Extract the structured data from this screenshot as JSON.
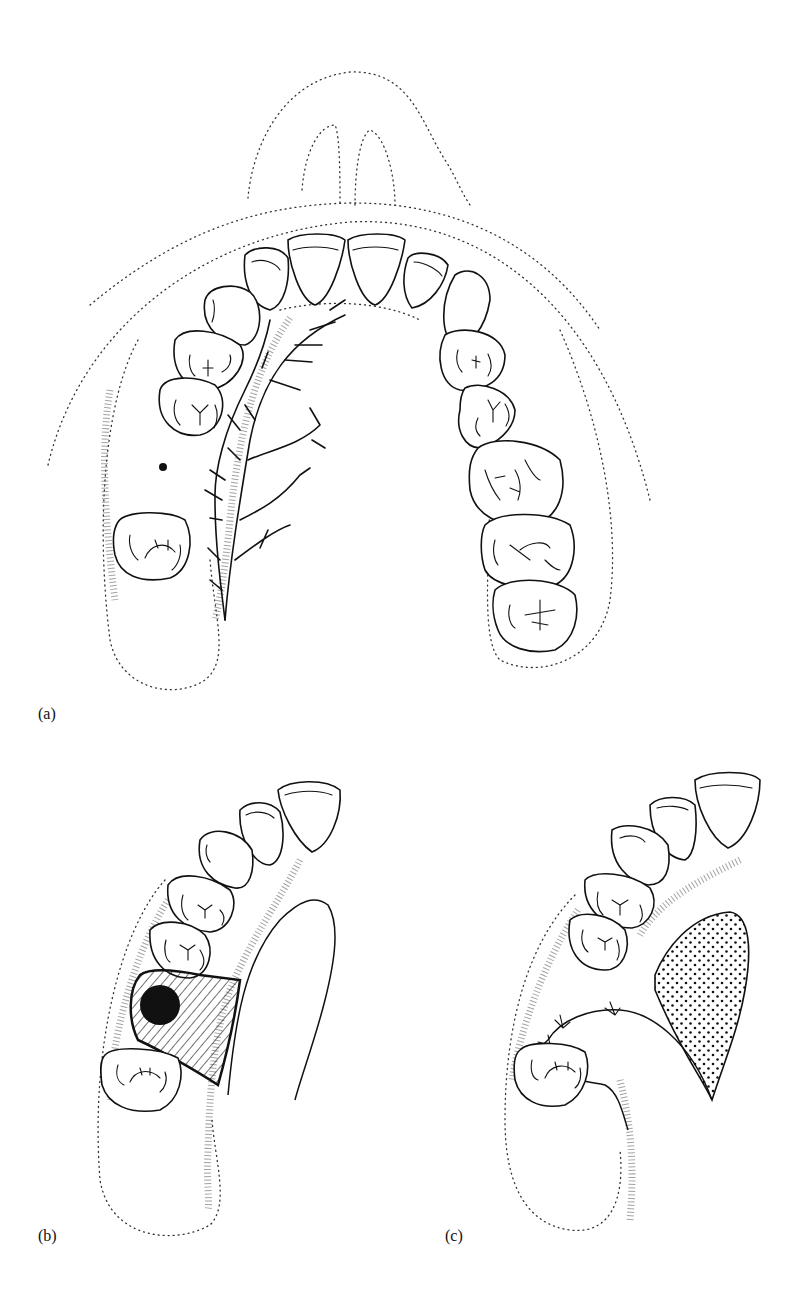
{
  "figure": {
    "panels": [
      {
        "id": "a",
        "label": "(a)",
        "description": "Full maxillary dental arch with dotted lip/nose outline, branching nerve/vessel pattern on left palate, stippled gingival margin and a dot marking the missing tooth site"
      },
      {
        "id": "b",
        "label": "(b)",
        "description": "Left half of arch showing hatched rectangular lesion area with a solid black circular defect between premolar and molar, palatal flap outline"
      },
      {
        "id": "c",
        "label": "(c)",
        "description": "Left half of arch after closure: sutured flap with cross-stitch marks and a dotted-pattern donor area on palate"
      }
    ],
    "colors": {
      "line": "#111111",
      "background": "#ffffff",
      "stipple": "#555555"
    }
  }
}
